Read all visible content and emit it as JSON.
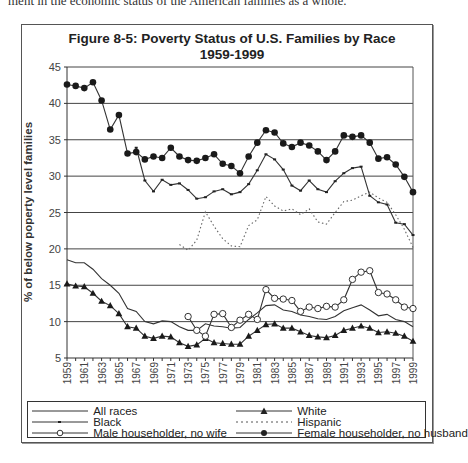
{
  "page": {
    "top_text": "ment in the economic status of the American families as a whole."
  },
  "chart_data": {
    "type": "line",
    "title": "Figure 8-5: Poverty Status of U.S. Families by Race",
    "subtitle": "1959-1999",
    "xlabel": "",
    "ylabel": "% of below poperty level families",
    "ylim": [
      5,
      45
    ],
    "yticks": [
      5,
      10,
      15,
      20,
      25,
      30,
      35,
      40,
      45
    ],
    "xlim": [
      1959,
      1999
    ],
    "xticks": [
      1959,
      1961,
      1963,
      1965,
      1967,
      1969,
      1971,
      1973,
      1975,
      1977,
      1979,
      1981,
      1983,
      1985,
      1987,
      1989,
      1991,
      1993,
      1995,
      1997,
      1999
    ],
    "grid": "horizontal",
    "legend_position": "bottom",
    "x": [
      1959,
      1960,
      1961,
      1962,
      1963,
      1964,
      1965,
      1966,
      1967,
      1968,
      1969,
      1970,
      1971,
      1972,
      1973,
      1974,
      1975,
      1976,
      1977,
      1978,
      1979,
      1980,
      1981,
      1982,
      1983,
      1984,
      1985,
      1986,
      1987,
      1988,
      1989,
      1990,
      1991,
      1992,
      1993,
      1994,
      1995,
      1996,
      1997,
      1998,
      1999
    ],
    "series": [
      {
        "name": "All races",
        "marker": "none",
        "dash": "solid",
        "values": [
          18.5,
          18.1,
          18.1,
          17.2,
          15.9,
          15.0,
          13.9,
          11.8,
          11.4,
          10.0,
          9.7,
          10.1,
          10.0,
          9.3,
          8.8,
          8.8,
          9.7,
          9.4,
          9.3,
          9.1,
          9.2,
          10.3,
          11.2,
          12.2,
          12.3,
          11.6,
          11.4,
          10.9,
          10.7,
          10.4,
          10.3,
          10.7,
          11.5,
          11.9,
          12.3,
          11.6,
          10.8,
          11.0,
          10.3,
          10.0,
          9.3
        ]
      },
      {
        "name": "White",
        "marker": "triangle",
        "dash": "solid",
        "values": [
          15.2,
          14.9,
          14.8,
          13.9,
          12.8,
          12.2,
          11.1,
          9.3,
          9.1,
          8.0,
          7.7,
          8.0,
          7.9,
          7.1,
          6.6,
          6.8,
          7.7,
          7.1,
          7.0,
          6.9,
          6.9,
          8.0,
          8.8,
          9.6,
          9.7,
          9.1,
          9.1,
          8.6,
          8.1,
          7.9,
          7.8,
          8.1,
          8.8,
          9.1,
          9.4,
          9.1,
          8.5,
          8.6,
          8.4,
          8.0,
          7.3
        ]
      },
      {
        "name": "Black",
        "marker": "dot-small",
        "dash": "solid",
        "values": [
          null,
          null,
          null,
          null,
          null,
          null,
          null,
          null,
          33.9,
          29.4,
          27.9,
          29.5,
          28.8,
          29.0,
          28.1,
          26.9,
          27.1,
          27.9,
          28.2,
          27.5,
          27.8,
          28.9,
          30.8,
          33.0,
          32.3,
          30.9,
          28.7,
          28.0,
          29.4,
          28.2,
          27.8,
          29.3,
          30.4,
          31.1,
          31.3,
          27.3,
          26.4,
          26.1,
          23.6,
          23.4,
          21.9
        ]
      },
      {
        "name": "Hispanic",
        "marker": "none",
        "dash": "dotted",
        "values": [
          null,
          null,
          null,
          null,
          null,
          null,
          null,
          null,
          null,
          null,
          null,
          null,
          null,
          20.6,
          19.8,
          21.2,
          25.1,
          23.1,
          21.4,
          20.4,
          20.3,
          23.2,
          24.0,
          27.2,
          25.9,
          25.2,
          25.5,
          24.7,
          25.5,
          23.7,
          23.4,
          25.0,
          26.5,
          26.7,
          27.3,
          27.8,
          27.0,
          26.4,
          24.7,
          22.7,
          20.2
        ]
      },
      {
        "name": "Male householder, no wife",
        "marker": "circle-open",
        "dash": "solid",
        "values": [
          null,
          null,
          null,
          null,
          null,
          null,
          null,
          null,
          null,
          null,
          null,
          null,
          null,
          null,
          10.7,
          8.8,
          8.0,
          11.0,
          11.1,
          9.2,
          10.2,
          11.0,
          10.3,
          14.4,
          13.2,
          13.1,
          12.9,
          11.4,
          12.0,
          11.8,
          12.1,
          12.0,
          13.0,
          15.8,
          16.8,
          17.0,
          14.0,
          13.8,
          13.0,
          12.0,
          11.8
        ]
      },
      {
        "name": "Female householder, no husband",
        "marker": "dot",
        "dash": "solid",
        "values": [
          42.6,
          42.4,
          42.1,
          42.9,
          40.4,
          36.4,
          38.4,
          33.1,
          33.3,
          32.3,
          32.7,
          32.5,
          33.9,
          32.7,
          32.2,
          32.1,
          32.5,
          33.0,
          31.7,
          31.4,
          30.4,
          32.7,
          34.6,
          36.3,
          36.0,
          34.5,
          34.0,
          34.6,
          34.2,
          33.4,
          32.2,
          33.4,
          35.6,
          35.4,
          35.6,
          34.6,
          32.4,
          32.6,
          31.6,
          29.9,
          27.8
        ]
      }
    ]
  },
  "legend": {
    "items": [
      {
        "label": "All races"
      },
      {
        "label": "White"
      },
      {
        "label": "Black"
      },
      {
        "label": "Hispanic"
      },
      {
        "label": "Male householder, no wife"
      },
      {
        "label": "Female householder, no husband"
      }
    ]
  }
}
